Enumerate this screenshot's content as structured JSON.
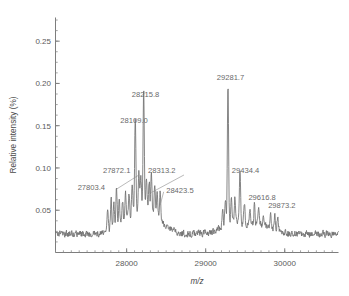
{
  "figure": {
    "background_color": "#ffffff",
    "trace_color": "#6f6f6f",
    "axis_color": "#7d7d7d",
    "label_color": "#6a6a6a"
  },
  "chart_data": {
    "type": "line",
    "title": "",
    "subtitle": "",
    "xlabel": "m/z",
    "ylabel": "Relative intensity (%)",
    "xlim": [
      27100,
      30680
    ],
    "ylim": [
      0.0,
      0.278
    ],
    "grid": false,
    "legend": null,
    "x_ticks": [
      28000,
      29000,
      30000
    ],
    "x_tick_labels": [
      "28000",
      "29000",
      "30000"
    ],
    "x_minor_tick_step": 100,
    "y_ticks": [
      0.05,
      0.1,
      0.15,
      0.2,
      0.25
    ],
    "y_tick_labels": [
      "0.05",
      "0.10",
      "0.15",
      "0.20",
      "0.25"
    ],
    "y_minor_tick_step": 0.0125,
    "annotations": [
      {
        "label": "27803.4",
        "mz": 27803.4,
        "intensity": 0.061,
        "text_x": 27380,
        "text_y": 0.0745,
        "leader": false
      },
      {
        "label": "27872.1",
        "mz": 27872.1,
        "intensity": 0.072,
        "text_x": 27700,
        "text_y": 0.0935,
        "leader": true
      },
      {
        "label": "28109.0",
        "mz": 28109.0,
        "intensity": 0.138,
        "text_x": 27920,
        "text_y": 0.1535,
        "leader": false
      },
      {
        "label": "28215.8",
        "mz": 28215.8,
        "intensity": 0.166,
        "text_x": 28065,
        "text_y": 0.1845,
        "leader": false
      },
      {
        "label": "28313.2",
        "mz": 28313.2,
        "intensity": 0.068,
        "text_x": 28270,
        "text_y": 0.0935,
        "leader": true
      },
      {
        "label": "28423.5",
        "mz": 28423.5,
        "intensity": 0.053,
        "text_x": 28500,
        "text_y": 0.07,
        "leader": true
      },
      {
        "label": "29281.7",
        "mz": 29281.7,
        "intensity": 0.186,
        "text_x": 29140,
        "text_y": 0.2045,
        "leader": false
      },
      {
        "label": "29434.4",
        "mz": 29434.4,
        "intensity": 0.083,
        "text_x": 29330,
        "text_y": 0.0945,
        "leader": false
      },
      {
        "label": "29616.8",
        "mz": 29616.8,
        "intensity": 0.047,
        "text_x": 29540,
        "text_y": 0.0625,
        "leader": false
      },
      {
        "label": "29873.2",
        "mz": 29873.2,
        "intensity": 0.04,
        "text_x": 29790,
        "text_y": 0.0525,
        "leader": false
      }
    ],
    "peaks": [
      {
        "mz": 27803.4,
        "intensity": 0.061
      },
      {
        "mz": 27872.1,
        "intensity": 0.072
      },
      {
        "mz": 28109.0,
        "intensity": 0.138
      },
      {
        "mz": 28215.8,
        "intensity": 0.166
      },
      {
        "mz": 28313.2,
        "intensity": 0.068
      },
      {
        "mz": 28423.5,
        "intensity": 0.053
      },
      {
        "mz": 29281.7,
        "intensity": 0.186
      },
      {
        "mz": 29434.4,
        "intensity": 0.083
      },
      {
        "mz": 29616.8,
        "intensity": 0.047
      },
      {
        "mz": 29873.2,
        "intensity": 0.04
      }
    ],
    "baseline": 0.022
  }
}
